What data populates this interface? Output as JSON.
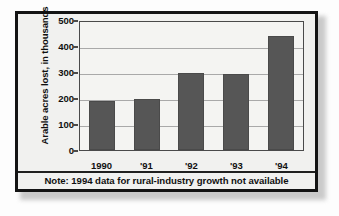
{
  "chart_data": {
    "type": "bar",
    "title": "",
    "xlabel": "",
    "ylabel": "Arable acres lost, in thousands",
    "categories": [
      "1990",
      "'91",
      "'92",
      "'93",
      "'94"
    ],
    "values": [
      190,
      200,
      302,
      297,
      445
    ],
    "ylim": [
      0,
      500
    ],
    "yticks": [
      0,
      100,
      200,
      300,
      400,
      500
    ],
    "ytick_labels": [
      "0",
      "100",
      "200",
      "300",
      "400",
      "500"
    ],
    "grid": true,
    "legend": null,
    "annotations": [
      "Note: 1994 data for rural-industry growth not available"
    ],
    "bar_color": "#565656",
    "plot_background": "#f4f4f2",
    "gridline_color": "#a9a9a9",
    "axis_color": "#4a4a4a"
  },
  "figure": {
    "background": "#f1f1ef",
    "border_color": "#141414",
    "note": "Note: 1994 data for rural-industry growth not available"
  }
}
